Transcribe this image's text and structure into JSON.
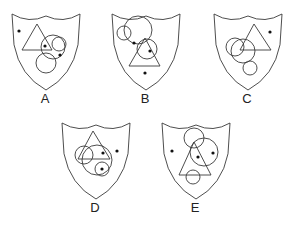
{
  "diagram": {
    "stroke_color": "#3a3a3a",
    "dot_color": "#111111",
    "options": [
      {
        "label": "A",
        "label_pos": [
          45,
          98
        ],
        "shield": {
          "x": 12,
          "y": 12,
          "w": 68,
          "h": 78
        },
        "triangle": [
          [
            37,
            24
          ],
          [
            22,
            50
          ],
          [
            52,
            50
          ]
        ],
        "circles": [
          {
            "cx": 53,
            "cy": 47,
            "r": 12
          },
          {
            "cx": 59,
            "cy": 44,
            "r": 7
          },
          {
            "cx": 46,
            "cy": 63,
            "r": 10
          }
        ],
        "dots": [
          [
            19,
            31
          ],
          [
            45,
            46
          ],
          [
            60,
            55
          ]
        ]
      },
      {
        "label": "B",
        "label_pos": [
          145,
          98
        ],
        "shield": {
          "x": 112,
          "y": 12,
          "w": 68,
          "h": 78
        },
        "triangle": [
          [
            145,
            38
          ],
          [
            129,
            66
          ],
          [
            160,
            66
          ]
        ],
        "circles": [
          {
            "cx": 124,
            "cy": 33,
            "r": 7
          },
          {
            "cx": 138,
            "cy": 30,
            "r": 14
          },
          {
            "cx": 147,
            "cy": 49,
            "r": 10
          }
        ],
        "dots": [
          [
            134,
            43
          ],
          [
            150,
            51
          ],
          [
            145,
            73
          ]
        ]
      },
      {
        "label": "C",
        "label_pos": [
          247,
          98
        ],
        "shield": {
          "x": 214,
          "y": 12,
          "w": 68,
          "h": 78
        },
        "triangle": [
          [
            254,
            24
          ],
          [
            240,
            50
          ],
          [
            271,
            50
          ]
        ],
        "circles": [
          {
            "cx": 235,
            "cy": 47,
            "r": 9
          },
          {
            "cx": 243,
            "cy": 51,
            "r": 12
          },
          {
            "cx": 250,
            "cy": 68,
            "r": 7
          }
        ],
        "dots": [
          [
            270,
            32
          ]
        ]
      },
      {
        "label": "D",
        "label_pos": [
          95,
          207
        ],
        "shield": {
          "x": 62,
          "y": 121,
          "w": 68,
          "h": 78
        },
        "triangle": [
          [
            93,
            131
          ],
          [
            78,
            159
          ],
          [
            110,
            159
          ]
        ],
        "circles": [
          {
            "cx": 84,
            "cy": 155,
            "r": 9
          },
          {
            "cx": 97,
            "cy": 160,
            "r": 15
          },
          {
            "cx": 102,
            "cy": 169,
            "r": 7
          }
        ],
        "dots": [
          [
            103,
            153
          ],
          [
            117,
            151
          ],
          [
            102,
            169
          ]
        ]
      },
      {
        "label": "E",
        "label_pos": [
          195,
          207
        ],
        "shield": {
          "x": 162,
          "y": 121,
          "w": 68,
          "h": 78
        },
        "triangle": [
          [
            194,
            142
          ],
          [
            179,
            175
          ],
          [
            211,
            175
          ]
        ],
        "circles": [
          {
            "cx": 194,
            "cy": 138,
            "r": 10
          },
          {
            "cx": 204,
            "cy": 152,
            "r": 14
          },
          {
            "cx": 193,
            "cy": 177,
            "r": 7
          }
        ],
        "dots": [
          [
            172,
            151
          ],
          [
            198,
            157
          ],
          [
            213,
            153
          ]
        ]
      }
    ]
  }
}
